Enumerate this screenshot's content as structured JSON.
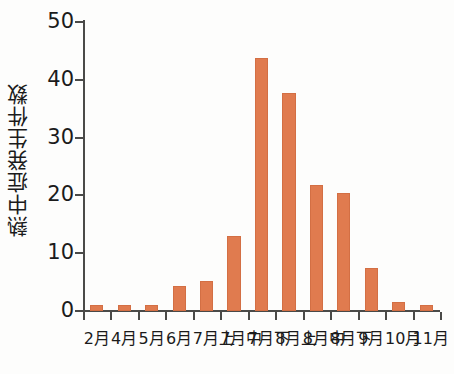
{
  "chart_data": {
    "type": "bar",
    "title": "",
    "xlabel": "",
    "ylabel": "熱中症発生件数",
    "categories": [
      "2月",
      "4月",
      "5月",
      "6月",
      "7月上",
      "7月中",
      "7月下",
      "8月上",
      "8月中",
      "8月下",
      "9月",
      "10月",
      "11月"
    ],
    "values": [
      1.0,
      1.0,
      1.0,
      4.3,
      5.2,
      13.0,
      43.8,
      37.7,
      21.8,
      20.4,
      7.5,
      1.6,
      1.0
    ],
    "ylim": [
      0,
      50
    ],
    "yticks": [
      0,
      10,
      20,
      30,
      40,
      50
    ],
    "ytick_labels": [
      "0",
      "10",
      "20",
      "30",
      "40",
      "50"
    ],
    "grid": false,
    "legend": false,
    "bar_color": "#e07b4f",
    "axis_color": "#4a4a48",
    "background_color": "#fdfdfc"
  }
}
